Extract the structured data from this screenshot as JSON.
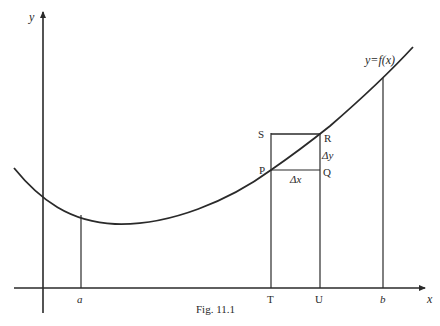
{
  "figure": {
    "caption": "Fig. 11.1",
    "axes": {
      "x_label": "x",
      "y_label": "y"
    },
    "curve_label": "y=f(x)",
    "x_ticks": {
      "a": "a",
      "T": "T",
      "U": "U",
      "b": "b"
    },
    "points": {
      "P": "P",
      "Q": "Q",
      "R": "R",
      "S": "S"
    },
    "increments": {
      "dx": "Δx",
      "dy": "Δy"
    }
  },
  "colors": {
    "ink": "#2a2a2a",
    "background": "#ffffff"
  }
}
